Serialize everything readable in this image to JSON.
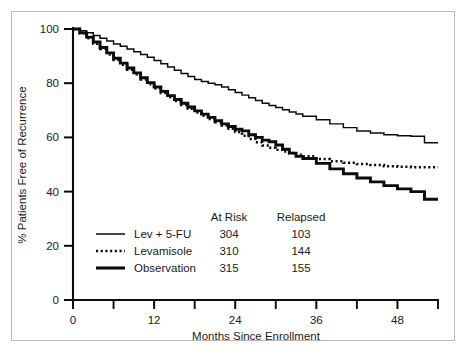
{
  "chart_data": {
    "type": "line",
    "title": "",
    "xlabel": "Months Since Enrollment",
    "ylabel": "% Patients Free of Recurrence",
    "xlim": [
      0,
      54
    ],
    "ylim": [
      0,
      100
    ],
    "grid": false,
    "legend_position": "inside-lower-left",
    "x_ticks_major": [
      0,
      12,
      24,
      36,
      48
    ],
    "x_ticks_minor": [
      6,
      18,
      30,
      42,
      54
    ],
    "y_ticks_major": [
      0,
      20,
      40,
      60,
      80,
      100
    ],
    "legend_columns": [
      "At Risk",
      "Relapsed"
    ],
    "series": [
      {
        "name": "Lev + 5-FU",
        "style": "thin-solid",
        "at_risk": "304",
        "relapsed": "103",
        "x": [
          0,
          1,
          2,
          3,
          4,
          5,
          6,
          7,
          8,
          9,
          10,
          11,
          12,
          13,
          14,
          15,
          16,
          17,
          18,
          19,
          20,
          21,
          22,
          23,
          24,
          25,
          26,
          27,
          28,
          29,
          30,
          31,
          32,
          33,
          34,
          36,
          38,
          40,
          42,
          44,
          46,
          48,
          50,
          52,
          54
        ],
        "y": [
          100,
          99.4,
          98.6,
          97.6,
          96.6,
          95.6,
          94.5,
          93.6,
          92.6,
          91.6,
          90.6,
          89.6,
          88.4,
          87.2,
          86.0,
          84.8,
          83.6,
          82.5,
          81.4,
          80.6,
          80.0,
          79.4,
          78.6,
          77.6,
          76.6,
          75.6,
          74.6,
          73.6,
          72.6,
          71.8,
          71.0,
          70.2,
          69.4,
          68.6,
          67.8,
          66.5,
          65.0,
          63.6,
          62.4,
          61.6,
          61.0,
          60.6,
          60.4,
          58.0,
          58.0
        ]
      },
      {
        "name": "Levamisole",
        "style": "dotted",
        "at_risk": "310",
        "relapsed": "144",
        "x": [
          0,
          1,
          2,
          3,
          4,
          5,
          6,
          7,
          8,
          9,
          10,
          11,
          12,
          13,
          14,
          15,
          16,
          17,
          18,
          19,
          20,
          21,
          22,
          23,
          24,
          25,
          26,
          27,
          28,
          29,
          30,
          31,
          32,
          33,
          34,
          36,
          38,
          40,
          42,
          44,
          46,
          48,
          50,
          52,
          54
        ],
        "y": [
          100,
          98.4,
          96.6,
          94.6,
          92.6,
          90.6,
          88.6,
          86.8,
          85.0,
          83.2,
          81.4,
          79.6,
          78.0,
          76.4,
          74.8,
          73.4,
          72.0,
          70.6,
          69.2,
          68.0,
          66.8,
          65.6,
          64.4,
          63.2,
          62.0,
          60.6,
          59.4,
          58.2,
          57.0,
          56.2,
          55.4,
          54.8,
          54.2,
          53.6,
          53.0,
          52.0,
          51.2,
          50.6,
          50.2,
          49.8,
          49.4,
          49.2,
          49.0,
          49.0,
          49.0
        ]
      },
      {
        "name": "Observation",
        "style": "thick-solid",
        "at_risk": "315",
        "relapsed": "155",
        "x": [
          0,
          1,
          2,
          3,
          4,
          5,
          6,
          7,
          8,
          9,
          10,
          11,
          12,
          13,
          14,
          15,
          16,
          17,
          18,
          19,
          20,
          21,
          22,
          23,
          24,
          25,
          26,
          27,
          28,
          29,
          30,
          31,
          32,
          33,
          34,
          36,
          38,
          40,
          42,
          44,
          46,
          48,
          50,
          52,
          54
        ],
        "y": [
          100,
          98.6,
          97.0,
          95.2,
          93.2,
          91.2,
          89.2,
          87.4,
          85.6,
          83.8,
          82.0,
          80.2,
          78.6,
          77.0,
          75.4,
          74.0,
          72.6,
          71.2,
          69.8,
          68.6,
          67.4,
          66.2,
          65.0,
          64.0,
          63.0,
          62.4,
          61.0,
          60.0,
          59.0,
          58.4,
          57.2,
          55.6,
          54.2,
          53.0,
          52.2,
          50.4,
          48.4,
          46.6,
          45.0,
          43.6,
          42.2,
          41.0,
          40.0,
          37.2,
          37.2
        ]
      }
    ]
  }
}
